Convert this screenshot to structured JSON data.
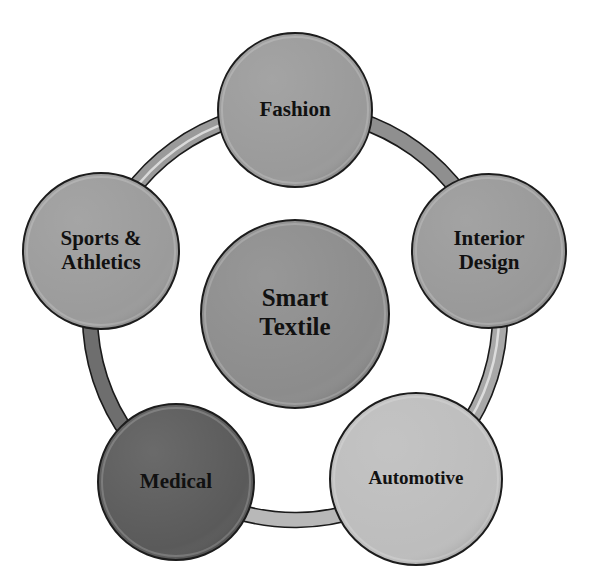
{
  "diagram": {
    "type": "cycle-hub",
    "center": {
      "lines": [
        "Smart",
        "Textile"
      ],
      "cx": 295,
      "cy": 314,
      "r": 94,
      "fill": "#8c8c8c",
      "font_size": 25
    },
    "ring": {
      "cx": 295,
      "cy": 315,
      "r": 205,
      "width": 15,
      "stroke_outline": "#1a1a1a"
    },
    "nodes": [
      {
        "id": "fashion",
        "lines": [
          "Fashion"
        ],
        "cx": 295,
        "cy": 110,
        "r": 77,
        "fill": "#9a9a9a",
        "font_size": 21
      },
      {
        "id": "interior-design",
        "lines": [
          "Interior",
          "Design"
        ],
        "cx": 489,
        "cy": 251,
        "r": 77,
        "fill": "#999999",
        "font_size": 21
      },
      {
        "id": "automotive",
        "lines": [
          "Automotive"
        ],
        "cx": 416,
        "cy": 479,
        "r": 86,
        "fill": "#bdbdbd",
        "font_size": 19
      },
      {
        "id": "medical",
        "lines": [
          "Medical"
        ],
        "cx": 176,
        "cy": 482,
        "r": 78,
        "fill": "#5a5a5a",
        "font_size": 21
      },
      {
        "id": "sports-athletics",
        "lines": [
          "Sports &",
          "Athletics"
        ],
        "cx": 101,
        "cy": 251,
        "r": 78,
        "fill": "#9b9b9b",
        "font_size": 21
      }
    ],
    "arcs": [
      {
        "from": "fashion",
        "to": "interior-design",
        "fill": "#8f8f8f",
        "highlight": false
      },
      {
        "from": "interior-design",
        "to": "automotive",
        "fill": "#a8a8a8",
        "highlight": true
      },
      {
        "from": "automotive",
        "to": "medical",
        "fill": "#b8b8b8",
        "highlight": false
      },
      {
        "from": "medical",
        "to": "sports-athletics",
        "fill": "#6e6e6e",
        "highlight": false
      },
      {
        "from": "sports-athletics",
        "to": "fashion",
        "fill": "#9a9a9a",
        "highlight": true
      }
    ]
  }
}
